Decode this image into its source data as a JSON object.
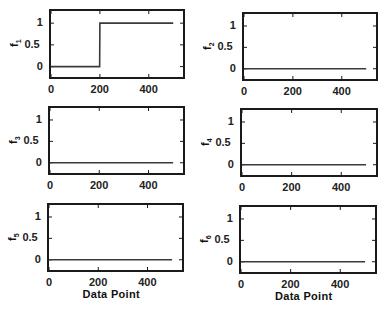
{
  "chart_data": [
    {
      "type": "line",
      "title": "",
      "ylabel": "f1",
      "xlabel": "",
      "xlim": [
        0,
        540
      ],
      "ylim": [
        -0.24,
        1.28
      ],
      "xticks": [
        0,
        200,
        400
      ],
      "yticks": [
        0,
        0.5,
        1
      ],
      "series": [
        {
          "name": "f1",
          "x": [
            0,
            199,
            200,
            500
          ],
          "y": [
            0,
            0,
            1,
            1
          ]
        }
      ],
      "grid": false
    },
    {
      "type": "line",
      "title": "",
      "ylabel": "f2",
      "xlabel": "",
      "xlim": [
        0,
        540
      ],
      "ylim": [
        -0.24,
        1.28
      ],
      "xticks": [
        0,
        200,
        400
      ],
      "yticks": [
        0,
        0.5,
        1
      ],
      "series": [
        {
          "name": "f2",
          "x": [
            0,
            500
          ],
          "y": [
            0,
            0
          ]
        }
      ],
      "grid": false
    },
    {
      "type": "line",
      "title": "",
      "ylabel": "f3",
      "xlabel": "",
      "xlim": [
        0,
        540
      ],
      "ylim": [
        -0.24,
        1.28
      ],
      "xticks": [
        0,
        200,
        400
      ],
      "yticks": [
        0,
        0.5,
        1
      ],
      "series": [
        {
          "name": "f3",
          "x": [
            0,
            500
          ],
          "y": [
            0,
            0
          ]
        }
      ],
      "grid": false
    },
    {
      "type": "line",
      "title": "",
      "ylabel": "f4",
      "xlabel": "",
      "xlim": [
        0,
        540
      ],
      "ylim": [
        -0.24,
        1.28
      ],
      "xticks": [
        0,
        200,
        400
      ],
      "yticks": [
        0,
        0.5,
        1
      ],
      "series": [
        {
          "name": "f4",
          "x": [
            0,
            500
          ],
          "y": [
            0,
            0
          ]
        }
      ],
      "grid": false
    },
    {
      "type": "line",
      "title": "",
      "ylabel": "f5",
      "xlabel": "Data Point",
      "xlim": [
        0,
        540
      ],
      "ylim": [
        -0.24,
        1.28
      ],
      "xticks": [
        0,
        200,
        400
      ],
      "yticks": [
        0,
        0.5,
        1
      ],
      "series": [
        {
          "name": "f5",
          "x": [
            0,
            500
          ],
          "y": [
            0,
            0
          ]
        }
      ],
      "grid": false
    },
    {
      "type": "line",
      "title": "",
      "ylabel": "f6",
      "xlabel": "Data Point",
      "xlim": [
        0,
        540
      ],
      "ylim": [
        -0.24,
        1.28
      ],
      "xticks": [
        0,
        200,
        400
      ],
      "yticks": [
        0,
        0.5,
        1
      ],
      "series": [
        {
          "name": "f6",
          "x": [
            0,
            500
          ],
          "y": [
            0,
            0
          ]
        }
      ],
      "grid": false
    }
  ],
  "panels": [
    {
      "ylabel_main": "f",
      "ylabel_sub": "1",
      "xlabel": "",
      "ytick_labels": [
        "1",
        "0.5",
        "0"
      ],
      "xtick_labels": [
        "0",
        "200",
        "400"
      ]
    },
    {
      "ylabel_main": "f",
      "ylabel_sub": "2",
      "xlabel": "",
      "ytick_labels": [
        "1",
        "0.5",
        "0"
      ],
      "xtick_labels": [
        "0",
        "200",
        "400"
      ]
    },
    {
      "ylabel_main": "f",
      "ylabel_sub": "3",
      "xlabel": "",
      "ytick_labels": [
        "1",
        "0.5",
        "0"
      ],
      "xtick_labels": [
        "0",
        "200",
        "400"
      ]
    },
    {
      "ylabel_main": "f",
      "ylabel_sub": "4",
      "xlabel": "",
      "ytick_labels": [
        "1",
        "0.5",
        "0"
      ],
      "xtick_labels": [
        "0",
        "200",
        "400"
      ]
    },
    {
      "ylabel_main": "f",
      "ylabel_sub": "5",
      "xlabel": "Data Point",
      "ytick_labels": [
        "1",
        "0.5",
        "0"
      ],
      "xtick_labels": [
        "0",
        "200",
        "400"
      ]
    },
    {
      "ylabel_main": "f",
      "ylabel_sub": "6",
      "xlabel": "Data Point",
      "ytick_labels": [
        "1",
        "0.5",
        "0"
      ],
      "xtick_labels": [
        "0",
        "200",
        "400"
      ]
    }
  ],
  "colors": {
    "line": "#3a3a3a",
    "axes": "#1a1a1a",
    "background": "#ffffff"
  }
}
